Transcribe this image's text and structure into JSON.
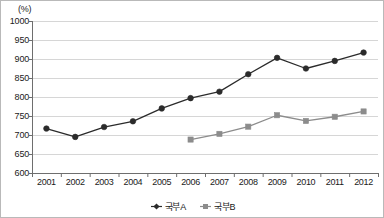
{
  "chart_data": {
    "type": "line",
    "title": "",
    "xlabel": "",
    "ylabel": "",
    "unit_label": "(%)",
    "grid": true,
    "legend_position": "bottom-center",
    "categories": [
      "2001",
      "2002",
      "2003",
      "2004",
      "2005",
      "2006",
      "2007",
      "2008",
      "2009",
      "2010",
      "2011",
      "2012"
    ],
    "ylim": [
      600,
      1000
    ],
    "yticks": [
      1000,
      950,
      900,
      850,
      800,
      750,
      700,
      650,
      600
    ],
    "series": [
      {
        "name": "국부A",
        "color": "#2b2b2b",
        "marker": "diamond",
        "values": [
          717,
          695,
          721,
          736,
          770,
          797,
          814,
          860,
          903,
          875,
          895,
          917
        ]
      },
      {
        "name": "국부B",
        "color": "#8c8c8c",
        "marker": "square",
        "values": [
          null,
          null,
          null,
          null,
          null,
          688,
          703,
          722,
          752,
          737,
          748,
          762
        ]
      }
    ]
  },
  "colors": {
    "series_a": "#2b2b2b",
    "series_b": "#8c8c8c",
    "grid": "#d6d6d6",
    "axis": "#6e6e6e",
    "border": "#b9b9b9",
    "text": "#1a1a1a"
  }
}
